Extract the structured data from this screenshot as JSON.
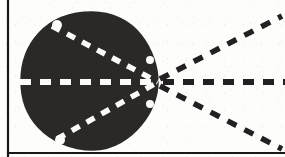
{
  "figure": {
    "kind": "technical-line-diagram",
    "canvas": {
      "width": 285,
      "height": 157
    },
    "colors": {
      "background": "#fdfdfc",
      "ink": "#222020",
      "lobe_fill": "#2b2928",
      "dash_white": "#fbfbfa",
      "border": "#1a1818"
    },
    "borders": {
      "left_rule": {
        "x": 8,
        "y1": 0,
        "y2": 157,
        "width": 2.2,
        "label": "left-frame-rule"
      },
      "bottom_rule": {
        "x1": 8,
        "x2": 285,
        "y": 153,
        "width": 2.2,
        "label": "bottom-frame-rule"
      }
    },
    "apex": {
      "x": 158,
      "y": 82,
      "label": "convergence-apex"
    },
    "lobe": {
      "label": "solid-lobe",
      "center_x": 90,
      "center_y": 82,
      "radius_x": 68,
      "radius_y": 70,
      "outline_path": "M 158 82 C 158 96 152 112 142 124 C 131 138 113 150 93 150 C 71 150 51 141 38 127 C 25 113 21 96 21 81 C 21 65 26 47 39 33 C 52 19 71 12 92 12 C 112 12 130 21 141 35 C 152 49 158 67 158 82 Z"
    },
    "inner_dashed_lines": [
      {
        "label": "upper-inner-dash",
        "x1": 52,
        "y1": 26,
        "x2": 158,
        "y2": 82,
        "color": "#fbfbfa",
        "width": 5.5,
        "dash": "9,8"
      },
      {
        "label": "center-inner-dash",
        "x1": 20,
        "y1": 82,
        "x2": 158,
        "y2": 82,
        "color": "#fbfbfa",
        "width": 6,
        "dash": "11,9"
      },
      {
        "label": "lower-inner-dash",
        "x1": 57,
        "y1": 139,
        "x2": 158,
        "y2": 82,
        "color": "#fbfbfa",
        "width": 5.5,
        "dash": "9,8"
      }
    ],
    "outer_dashed_rays": [
      {
        "label": "upper-right-ray",
        "x1": 160,
        "y1": 79,
        "x2": 282,
        "y2": 16,
        "color": "#222020",
        "width": 5.5,
        "dash": "10,9"
      },
      {
        "label": "center-right-ray",
        "x1": 163,
        "y1": 82,
        "x2": 285,
        "y2": 82,
        "color": "#222020",
        "width": 6,
        "dash": "11,9"
      },
      {
        "label": "lower-right-ray",
        "x1": 160,
        "y1": 86,
        "x2": 282,
        "y2": 149,
        "color": "#222020",
        "width": 5.5,
        "dash": "10,9"
      }
    ],
    "notches": [
      {
        "label": "top-left-notch",
        "cx": 57,
        "cy": 25,
        "r": 5
      },
      {
        "label": "bottom-left-notch",
        "cx": 60,
        "cy": 140,
        "r": 5
      },
      {
        "label": "right-waist-notch",
        "cx": 150,
        "cy": 60,
        "r": 4
      },
      {
        "label": "right-lower-notch",
        "cx": 150,
        "cy": 104,
        "r": 4
      }
    ]
  }
}
